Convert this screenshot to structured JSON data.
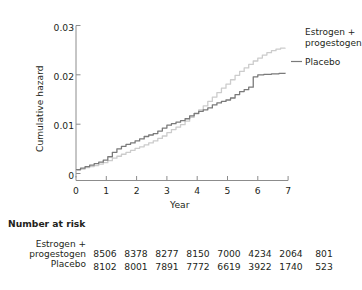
{
  "chart_data": {
    "type": "line",
    "title": "",
    "xlabel": "Year",
    "ylabel": "Cumulative hazard",
    "xlim": [
      0,
      7
    ],
    "ylim": [
      0,
      0.03
    ],
    "xticks": [
      "0",
      "1",
      "2",
      "3",
      "4",
      "5",
      "6",
      "7"
    ],
    "yticks": [
      "0",
      "0.01",
      "0.02",
      "0.03"
    ],
    "grid": false,
    "legend_position": "right-inside",
    "series": [
      {
        "name": "Estrogen + progestogen",
        "color": "#cccccc",
        "label_lines": "Estrogen +\nprogestogen",
        "points": [
          [
            0.0,
            0.0007
          ],
          [
            0.15,
            0.0009
          ],
          [
            0.3,
            0.0012
          ],
          [
            0.45,
            0.0014
          ],
          [
            0.6,
            0.0016
          ],
          [
            0.75,
            0.0019
          ],
          [
            0.9,
            0.0022
          ],
          [
            1.05,
            0.0026
          ],
          [
            1.2,
            0.0031
          ],
          [
            1.35,
            0.0035
          ],
          [
            1.5,
            0.0039
          ],
          [
            1.65,
            0.0043
          ],
          [
            1.8,
            0.0047
          ],
          [
            1.95,
            0.0051
          ],
          [
            2.1,
            0.0054
          ],
          [
            2.25,
            0.0058
          ],
          [
            2.4,
            0.0062
          ],
          [
            2.55,
            0.0066
          ],
          [
            2.7,
            0.0071
          ],
          [
            2.85,
            0.0076
          ],
          [
            3.0,
            0.0083
          ],
          [
            3.15,
            0.0089
          ],
          [
            3.3,
            0.0094
          ],
          [
            3.45,
            0.0099
          ],
          [
            3.6,
            0.0106
          ],
          [
            3.75,
            0.0114
          ],
          [
            3.9,
            0.0121
          ],
          [
            4.05,
            0.0129
          ],
          [
            4.2,
            0.0137
          ],
          [
            4.35,
            0.0146
          ],
          [
            4.5,
            0.0155
          ],
          [
            4.65,
            0.0164
          ],
          [
            4.8,
            0.0173
          ],
          [
            4.95,
            0.0181
          ],
          [
            5.1,
            0.019
          ],
          [
            5.25,
            0.0199
          ],
          [
            5.4,
            0.0207
          ],
          [
            5.55,
            0.0214
          ],
          [
            5.7,
            0.0221
          ],
          [
            5.85,
            0.0228
          ],
          [
            6.0,
            0.0234
          ],
          [
            6.15,
            0.024
          ],
          [
            6.3,
            0.0245
          ],
          [
            6.45,
            0.0249
          ],
          [
            6.6,
            0.0252
          ],
          [
            6.75,
            0.0254
          ],
          [
            6.9,
            0.0255
          ]
        ]
      },
      {
        "name": "Placebo",
        "color": "#7a7a7a",
        "label_lines": "Placebo",
        "points": [
          [
            0.0,
            0.0008
          ],
          [
            0.15,
            0.0011
          ],
          [
            0.3,
            0.0014
          ],
          [
            0.45,
            0.0017
          ],
          [
            0.6,
            0.002
          ],
          [
            0.75,
            0.0023
          ],
          [
            0.9,
            0.0027
          ],
          [
            1.05,
            0.0034
          ],
          [
            1.2,
            0.0043
          ],
          [
            1.35,
            0.005
          ],
          [
            1.5,
            0.0055
          ],
          [
            1.65,
            0.0059
          ],
          [
            1.8,
            0.0062
          ],
          [
            1.95,
            0.0066
          ],
          [
            2.1,
            0.007
          ],
          [
            2.25,
            0.0075
          ],
          [
            2.4,
            0.0078
          ],
          [
            2.55,
            0.0081
          ],
          [
            2.7,
            0.0086
          ],
          [
            2.85,
            0.0092
          ],
          [
            3.0,
            0.0098
          ],
          [
            3.15,
            0.0101
          ],
          [
            3.3,
            0.0104
          ],
          [
            3.45,
            0.0107
          ],
          [
            3.6,
            0.0111
          ],
          [
            3.75,
            0.0117
          ],
          [
            3.9,
            0.0122
          ],
          [
            4.05,
            0.0126
          ],
          [
            4.2,
            0.0129
          ],
          [
            4.35,
            0.0133
          ],
          [
            4.5,
            0.0139
          ],
          [
            4.65,
            0.0143
          ],
          [
            4.8,
            0.0146
          ],
          [
            4.95,
            0.0149
          ],
          [
            5.1,
            0.0153
          ],
          [
            5.25,
            0.016
          ],
          [
            5.4,
            0.0166
          ],
          [
            5.55,
            0.017
          ],
          [
            5.7,
            0.0175
          ],
          [
            5.85,
            0.0196
          ],
          [
            6.0,
            0.02
          ],
          [
            6.2,
            0.0201
          ],
          [
            6.45,
            0.0202
          ],
          [
            6.7,
            0.0203
          ],
          [
            6.9,
            0.0204
          ]
        ]
      }
    ]
  },
  "legend": {
    "estrogen_label": "Estrogen +\nprogestogen",
    "placebo_label": "Placebo"
  },
  "risk_table": {
    "title": "Number at risk",
    "rows": [
      {
        "label": "Estrogen +\nprogestogen",
        "values": [
          "8506",
          "8378",
          "8277",
          "8150",
          "7000",
          "4234",
          "2064",
          "801"
        ]
      },
      {
        "label": "Placebo",
        "values": [
          "8102",
          "8001",
          "7891",
          "7772",
          "6619",
          "3922",
          "1740",
          "523"
        ]
      }
    ]
  }
}
